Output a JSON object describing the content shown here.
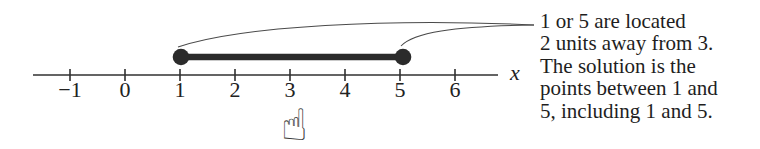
{
  "number_line": {
    "axis_label": "x",
    "tick_labels": [
      "−1",
      "0",
      "1",
      "2",
      "3",
      "4",
      "5",
      "6"
    ],
    "segment": {
      "from": 1,
      "to": 5,
      "closed_endpoints": true
    },
    "pointer_icon": "☝",
    "pointer_target": "3"
  },
  "annotation": {
    "lines": [
      "1 or 5 are located",
      "2 units away from 3.",
      "The solution is the",
      "points between 1 and",
      "5, including 1 and 5."
    ]
  },
  "colors": {
    "ink": "#2b2b2b",
    "background": "#ffffff"
  }
}
